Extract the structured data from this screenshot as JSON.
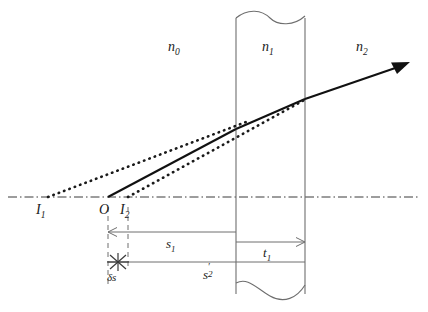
{
  "figure": {
    "background_color": "#ffffff",
    "line_color": "#2b2b2b",
    "thin_line_color": "#6e6e6e",
    "width": 428,
    "height": 312
  },
  "media_labels": {
    "n0": {
      "base": "n",
      "sub": "0"
    },
    "n1": {
      "base": "n",
      "sub": "1"
    },
    "n2": {
      "base": "n",
      "sub": "2"
    }
  },
  "point_labels": {
    "i1": {
      "base": "I",
      "sub": "1"
    },
    "o": {
      "base": "O",
      "sub": ""
    },
    "i2": {
      "base": "I",
      "sub": "2"
    }
  },
  "dimension_labels": {
    "s1": {
      "base": "s",
      "sub": "1"
    },
    "t1": {
      "base": "t",
      "sub": "1"
    },
    "s2prime": {
      "base": "s",
      "sub": "2",
      "prime": "′"
    },
    "ds": {
      "base": "δs"
    }
  },
  "geometry": {
    "axis_y": 197,
    "slab_left_x": 236,
    "slab_right_x": 305,
    "point_i1_x": 48,
    "point_o_x": 108,
    "point_i2_x": 128,
    "arrow_tip": [
      408,
      62
    ],
    "dim_line_s1_y": 232,
    "dim_line_s2_y": 262
  }
}
